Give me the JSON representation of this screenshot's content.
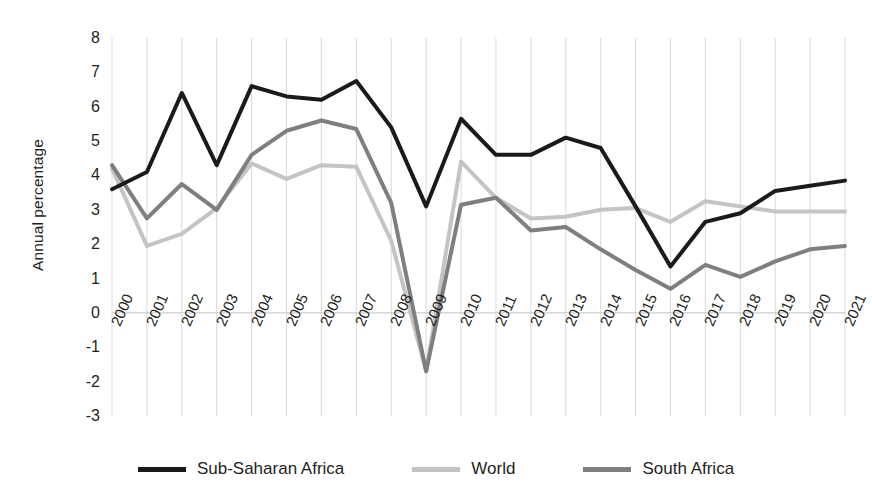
{
  "chart_data": {
    "type": "line",
    "title": "",
    "xlabel": "",
    "ylabel": "Annual percentage",
    "grid": "vertical",
    "legend_position": "bottom",
    "xlim": [
      2000,
      2021
    ],
    "ylim": [
      -3,
      8
    ],
    "ytick_labels": [
      "8",
      "7",
      "6",
      "5",
      "4",
      "3",
      "2",
      "1",
      "0",
      "-1",
      "-2",
      "-3"
    ],
    "yticks": [
      8,
      7,
      6,
      5,
      4,
      3,
      2,
      1,
      0,
      -1,
      -2,
      -3
    ],
    "categories": [
      "2000",
      "2001",
      "2002",
      "2003",
      "2004",
      "2005",
      "2006",
      "2007",
      "2008",
      "2009",
      "2010",
      "2011",
      "2012",
      "2013",
      "2014",
      "2015",
      "2016",
      "2017",
      "2018",
      "2019",
      "2020",
      "2021"
    ],
    "x": [
      2000,
      2001,
      2002,
      2003,
      2004,
      2005,
      2006,
      2007,
      2008,
      2009,
      2010,
      2011,
      2012,
      2013,
      2014,
      2015,
      2016,
      2017,
      2018,
      2019,
      2020,
      2021
    ],
    "series": [
      {
        "name": "Sub-Saharan Africa",
        "color": "#1a1a1a",
        "width": 4.0,
        "values": [
          3.6,
          4.1,
          6.4,
          4.3,
          6.6,
          6.3,
          6.2,
          6.75,
          5.4,
          3.1,
          5.65,
          4.6,
          4.6,
          5.1,
          4.8,
          3.1,
          1.35,
          2.65,
          2.9,
          3.55,
          3.7,
          3.85
        ]
      },
      {
        "name": "World",
        "color": "#c4c4c4",
        "width": 4.0,
        "values": [
          4.2,
          1.95,
          2.3,
          3.05,
          4.35,
          3.9,
          4.3,
          4.25,
          2.1,
          -1.7,
          4.4,
          3.35,
          2.75,
          2.8,
          3.0,
          3.05,
          2.65,
          3.25,
          3.1,
          2.95,
          2.95,
          2.95
        ]
      },
      {
        "name": "South Africa",
        "color": "#7f7f7f",
        "width": 4.0,
        "values": [
          4.3,
          2.75,
          3.75,
          3.0,
          4.6,
          5.3,
          5.6,
          5.35,
          3.2,
          -1.7,
          3.15,
          3.35,
          2.4,
          2.5,
          1.85,
          1.25,
          0.7,
          1.4,
          1.05,
          1.5,
          1.85,
          1.95
        ]
      }
    ],
    "legend": [
      {
        "label": "Sub-Saharan Africa",
        "color": "#1a1a1a"
      },
      {
        "label": "World",
        "color": "#c4c4c4"
      },
      {
        "label": "South Africa",
        "color": "#7f7f7f"
      }
    ],
    "gridline_color": "#d9d9d9",
    "axis_color": "#bfbfbf",
    "background": "#ffffff"
  }
}
